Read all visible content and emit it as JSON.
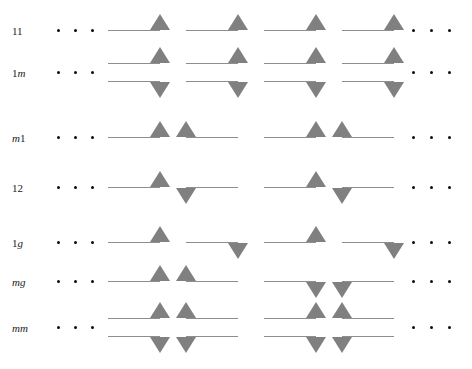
{
  "figure": {
    "name": "group-symbol-diagram",
    "width": 472,
    "height": 369,
    "background": "#ffffff",
    "line_color": "#8e8e8e",
    "triangle_color": "#808080",
    "dot_color": "#0d0d0d",
    "label_color": "#1a1a1a",
    "ellipsis_dot_count": 3,
    "cells_per_row": 4,
    "cell_pitch": 78,
    "rows": [
      {
        "label": "11",
        "label_parts": [
          {
            "text": "1",
            "italic": false
          },
          {
            "text": "1",
            "italic": false
          }
        ],
        "label_x": 12,
        "label_y": 25,
        "y": 30,
        "lines": 1,
        "left_dots_x": [
          57,
          74,
          91
        ],
        "right_dots_x": [
          412,
          430,
          448
        ],
        "dots_y": 30,
        "cells_x": 108,
        "cells": [
          {
            "align": "right",
            "top": "up",
            "bottom": null
          },
          {
            "align": "right",
            "top": "up",
            "bottom": null
          },
          {
            "align": "right",
            "top": "up",
            "bottom": null
          },
          {
            "align": "right",
            "top": "up",
            "bottom": null
          }
        ]
      },
      {
        "label": "1m",
        "label_parts": [
          {
            "text": "1",
            "italic": false
          },
          {
            "text": "m",
            "italic": true
          }
        ],
        "label_x": 12,
        "label_y": 67,
        "y": 63,
        "lines": 2,
        "left_dots_x": [
          57,
          74,
          91
        ],
        "right_dots_x": [
          412,
          430,
          448
        ],
        "dots_y": 72,
        "cells_x": 108,
        "cells": [
          {
            "align": "right",
            "top": "up",
            "bottom": "down"
          },
          {
            "align": "right",
            "top": "up",
            "bottom": "down"
          },
          {
            "align": "right",
            "top": "up",
            "bottom": "down"
          },
          {
            "align": "right",
            "top": "up",
            "bottom": "down"
          }
        ]
      },
      {
        "label": "m1",
        "label_parts": [
          {
            "text": "m",
            "italic": true
          },
          {
            "text": "1",
            "italic": false
          }
        ],
        "label_x": 12,
        "label_y": 132,
        "y": 137,
        "lines": 1,
        "left_dots_x": [
          57,
          74,
          91
        ],
        "right_dots_x": [
          412,
          430,
          448
        ],
        "dots_y": 137,
        "cells_x": 108,
        "cells": [
          {
            "align": "right",
            "top": "up",
            "bottom": null
          },
          {
            "align": "left",
            "top": "up",
            "bottom": null
          },
          {
            "align": "right",
            "top": "up",
            "bottom": null
          },
          {
            "align": "left",
            "top": "up",
            "bottom": null
          }
        ]
      },
      {
        "label": "12",
        "label_parts": [
          {
            "text": "1",
            "italic": false
          },
          {
            "text": "2",
            "italic": false
          }
        ],
        "label_x": 12,
        "label_y": 182,
        "y": 187,
        "lines": 1,
        "left_dots_x": [
          57,
          74,
          91
        ],
        "right_dots_x": [
          412,
          430,
          448
        ],
        "dots_y": 187,
        "cells_x": 108,
        "cells": [
          {
            "align": "right",
            "top": "up",
            "bottom": null
          },
          {
            "align": "left",
            "top": "down",
            "bottom": null
          },
          {
            "align": "right",
            "top": "up",
            "bottom": null
          },
          {
            "align": "left",
            "top": "down",
            "bottom": null
          }
        ]
      },
      {
        "label": "1g",
        "label_parts": [
          {
            "text": "1",
            "italic": false
          },
          {
            "text": "g",
            "italic": true
          }
        ],
        "label_x": 12,
        "label_y": 237,
        "y": 242,
        "lines": 1,
        "left_dots_x": [
          57,
          74,
          91
        ],
        "right_dots_x": [
          412,
          430,
          448
        ],
        "dots_y": 242,
        "cells_x": 108,
        "cells": [
          {
            "align": "right",
            "top": "up",
            "bottom": null
          },
          {
            "align": "right",
            "top": "down",
            "bottom": null
          },
          {
            "align": "right",
            "top": "up",
            "bottom": null
          },
          {
            "align": "right",
            "top": "down",
            "bottom": null
          }
        ]
      },
      {
        "label": "mg",
        "label_parts": [
          {
            "text": "m",
            "italic": true
          },
          {
            "text": "g",
            "italic": true
          }
        ],
        "label_x": 12,
        "label_y": 276,
        "y": 281,
        "lines": 1,
        "left_dots_x": [
          57,
          74,
          91
        ],
        "right_dots_x": [
          412,
          430,
          448
        ],
        "dots_y": 281,
        "cells_x": 108,
        "cells": [
          {
            "align": "right",
            "top": "up",
            "bottom": null
          },
          {
            "align": "left",
            "top": "up",
            "bottom": null
          },
          {
            "align": "right",
            "top": "down",
            "bottom": null
          },
          {
            "align": "left",
            "top": "down",
            "bottom": null
          }
        ]
      },
      {
        "label": "mm",
        "label_parts": [
          {
            "text": "m",
            "italic": true
          },
          {
            "text": "m",
            "italic": true
          }
        ],
        "label_x": 12,
        "label_y": 322,
        "y": 318,
        "lines": 2,
        "left_dots_x": [
          57,
          74,
          91
        ],
        "right_dots_x": [
          412,
          430,
          448
        ],
        "dots_y": 327,
        "cells_x": 108,
        "cells": [
          {
            "align": "right",
            "top": "up",
            "bottom": "down"
          },
          {
            "align": "left",
            "top": "up",
            "bottom": "down"
          },
          {
            "align": "right",
            "top": "up",
            "bottom": "down"
          },
          {
            "align": "left",
            "top": "up",
            "bottom": "down"
          }
        ]
      }
    ]
  }
}
